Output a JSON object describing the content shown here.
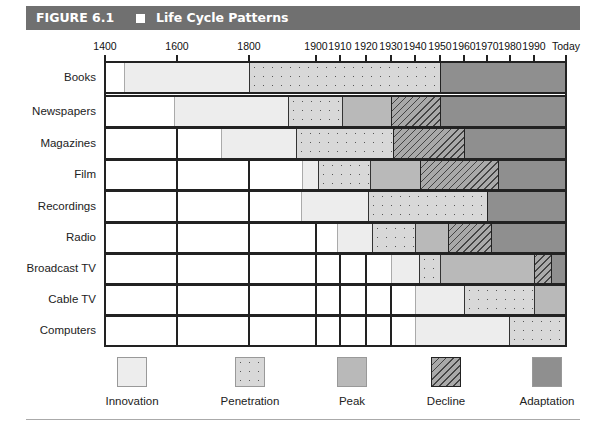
{
  "header": {
    "figure_number": "FIGURE 6.1",
    "title": "Life Cycle Patterns"
  },
  "chart_data": {
    "type": "bar",
    "subtype": "horizontal-stacked-timeline",
    "title": "Life Cycle Patterns",
    "figure_label": "FIGURE 6.1",
    "x_ticks": [
      "1400",
      "1600",
      "1800",
      "1900",
      "1910",
      "1920",
      "1930",
      "1940",
      "1950",
      "1960",
      "1970",
      "1980",
      "1990",
      "Today"
    ],
    "x_tick_px": [
      105,
      177,
      249,
      316,
      340,
      366,
      391,
      415,
      440,
      464,
      487,
      510,
      534,
      566
    ],
    "stages": [
      "Innovation",
      "Penetration",
      "Peak",
      "Decline",
      "Adaptation"
    ],
    "rows": [
      {
        "label": "Books",
        "top": 61,
        "height": 33,
        "phases": [
          {
            "stage": "Innovation",
            "start": 1450,
            "end": 1800,
            "x0": 124,
            "x1": 249
          },
          {
            "stage": "Penetration",
            "start": 1800,
            "end": 1950,
            "x0": 249,
            "x1": 440
          },
          {
            "stage": "Adaptation",
            "start": 1950,
            "end": "Today",
            "x0": 440,
            "x1": 566
          }
        ]
      },
      {
        "label": "Newspapers",
        "top": 95,
        "height": 33,
        "phases": [
          {
            "stage": "Innovation",
            "start": 1600,
            "end": 1890,
            "x0": 174,
            "x1": 288
          },
          {
            "stage": "Penetration",
            "start": 1890,
            "end": 1910,
            "x0": 288,
            "x1": 342
          },
          {
            "stage": "Peak",
            "start": 1910,
            "end": 1930,
            "x0": 342,
            "x1": 391
          },
          {
            "stage": "Decline",
            "start": 1930,
            "end": 1950,
            "x0": 391,
            "x1": 440
          },
          {
            "stage": "Adaptation",
            "start": 1950,
            "end": "Today",
            "x0": 440,
            "x1": 566
          }
        ]
      },
      {
        "label": "Magazines",
        "top": 127,
        "height": 33,
        "phases": [
          {
            "stage": "Innovation",
            "start": 1740,
            "end": 1890,
            "x0": 221,
            "x1": 296
          },
          {
            "stage": "Penetration",
            "start": 1890,
            "end": 1930,
            "x0": 296,
            "x1": 393
          },
          {
            "stage": "Decline",
            "start": 1930,
            "end": 1960,
            "x0": 393,
            "x1": 464
          },
          {
            "stage": "Adaptation",
            "start": 1960,
            "end": "Today",
            "x0": 464,
            "x1": 566
          }
        ]
      },
      {
        "label": "Film",
        "top": 159,
        "height": 32,
        "phases": [
          {
            "stage": "Innovation",
            "start": 1895,
            "end": 1900,
            "x0": 302,
            "x1": 318
          },
          {
            "stage": "Penetration",
            "start": 1900,
            "end": 1922,
            "x0": 318,
            "x1": 370
          },
          {
            "stage": "Peak",
            "start": 1922,
            "end": 1942,
            "x0": 370,
            "x1": 420
          },
          {
            "stage": "Decline",
            "start": 1942,
            "end": 1975,
            "x0": 420,
            "x1": 498
          },
          {
            "stage": "Adaptation",
            "start": 1975,
            "end": "Today",
            "x0": 498,
            "x1": 566
          }
        ]
      },
      {
        "label": "Recordings",
        "top": 190,
        "height": 33,
        "phases": [
          {
            "stage": "Innovation",
            "start": 1895,
            "end": 1920,
            "x0": 301,
            "x1": 368
          },
          {
            "stage": "Penetration",
            "start": 1920,
            "end": 1970,
            "x0": 368,
            "x1": 487
          },
          {
            "stage": "Adaptation",
            "start": 1970,
            "end": "Today",
            "x0": 487,
            "x1": 566
          }
        ]
      },
      {
        "label": "Radio",
        "top": 222,
        "height": 32,
        "phases": [
          {
            "stage": "Innovation",
            "start": 1908,
            "end": 1922,
            "x0": 337,
            "x1": 372
          },
          {
            "stage": "Penetration",
            "start": 1922,
            "end": 1940,
            "x0": 372,
            "x1": 415
          },
          {
            "stage": "Peak",
            "start": 1940,
            "end": 1953,
            "x0": 415,
            "x1": 448
          },
          {
            "stage": "Decline",
            "start": 1953,
            "end": 1972,
            "x0": 448,
            "x1": 491
          },
          {
            "stage": "Adaptation",
            "start": 1972,
            "end": "Today",
            "x0": 491,
            "x1": 566
          }
        ]
      },
      {
        "label": "Broadcast TV",
        "top": 253,
        "height": 32,
        "phases": [
          {
            "stage": "Innovation",
            "start": 1930,
            "end": 1941,
            "x0": 391,
            "x1": 419
          },
          {
            "stage": "Penetration",
            "start": 1941,
            "end": 1950,
            "x0": 419,
            "x1": 440
          },
          {
            "stage": "Peak",
            "start": 1950,
            "end": 1990,
            "x0": 440,
            "x1": 534
          },
          {
            "stage": "Decline",
            "start": 1990,
            "end": 1997,
            "x0": 534,
            "x1": 551
          },
          {
            "stage": "Adaptation",
            "start": 1997,
            "end": "Today",
            "x0": 551,
            "x1": 566
          }
        ]
      },
      {
        "label": "Cable TV",
        "top": 284,
        "height": 32,
        "phases": [
          {
            "stage": "Innovation",
            "start": 1940,
            "end": 1960,
            "x0": 415,
            "x1": 464
          },
          {
            "stage": "Penetration",
            "start": 1960,
            "end": 1990,
            "x0": 464,
            "x1": 534
          },
          {
            "stage": "Peak",
            "start": 1990,
            "end": "Today",
            "x0": 534,
            "x1": 566
          }
        ]
      },
      {
        "label": "Computers",
        "top": 315,
        "height": 32,
        "phases": [
          {
            "stage": "Innovation",
            "start": 1940,
            "end": 1980,
            "x0": 415,
            "x1": 509
          },
          {
            "stage": "Penetration",
            "start": 1980,
            "end": "Today",
            "x0": 509,
            "x1": 566
          }
        ]
      }
    ],
    "legend": [
      {
        "label": "Innovation",
        "color": "#ededed",
        "pattern": "solid-light"
      },
      {
        "label": "Penetration",
        "color": "#d8d8d8",
        "pattern": "dotted"
      },
      {
        "label": "Peak",
        "color": "#b9b9b9",
        "pattern": "solid"
      },
      {
        "label": "Decline",
        "color": "#a9a9a9",
        "pattern": "hatched"
      },
      {
        "label": "Adaptation",
        "color": "#8f8f8f",
        "pattern": "solid-dark"
      }
    ],
    "legend_position": "bottom",
    "xlabel": "",
    "ylabel": ""
  }
}
